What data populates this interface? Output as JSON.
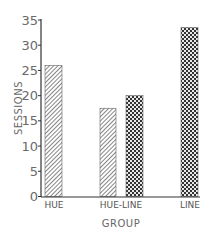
{
  "chart_data": {
    "type": "bar",
    "title": "",
    "xlabel": "GROUP",
    "ylabel": "SESSIONS",
    "ylim": [
      0,
      35
    ],
    "yticks": [
      0,
      5,
      10,
      15,
      20,
      25,
      30,
      35
    ],
    "grid": false,
    "legend": null,
    "categories": [
      "HUE",
      "HUE-LINE",
      "LINE"
    ],
    "series": [
      {
        "name": "hatched",
        "pattern": "diagonal-hatch",
        "values": [
          26,
          17.5,
          null
        ]
      },
      {
        "name": "checkered",
        "pattern": "checkerboard",
        "values": [
          null,
          20,
          33.5
        ]
      }
    ],
    "bars": [
      {
        "category": "HUE",
        "pattern": "diagonal-hatch",
        "value": 26
      },
      {
        "category": "HUE-LINE",
        "pattern": "diagonal-hatch",
        "value": 17.5
      },
      {
        "category": "HUE-LINE",
        "pattern": "checkerboard",
        "value": 20
      },
      {
        "category": "LINE",
        "pattern": "checkerboard",
        "value": 33.5
      }
    ],
    "colors": {
      "axis": "#333333",
      "bar_outline": "#555555",
      "text": "#666666"
    }
  }
}
